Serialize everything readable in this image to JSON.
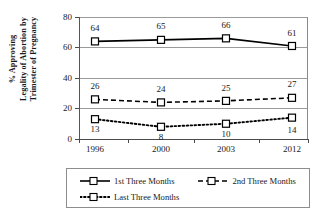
{
  "chart_data": {
    "type": "line",
    "title": "",
    "xlabel": "",
    "ylabel": "% Approving Legality of Abortion by Trimester of Pregnancy",
    "ylabel_lines": [
      "% Approving",
      "Legality of Abortion by",
      "Trimester of Pregnancy"
    ],
    "categories": [
      "1996",
      "2000",
      "2003",
      "2012"
    ],
    "ylim": [
      0,
      80
    ],
    "yticks": [
      "0",
      "20",
      "40",
      "60",
      "80"
    ],
    "grid": true,
    "legend_position": "bottom",
    "series": [
      {
        "name": "1st Three Months",
        "values": [
          64,
          65,
          66,
          61
        ],
        "line_style": "solid",
        "marker": "open-square",
        "label_position": "above",
        "color": "#000000"
      },
      {
        "name": "2nd Three Months",
        "values": [
          26,
          24,
          25,
          27
        ],
        "line_style": "dashed",
        "marker": "open-square",
        "label_position": "above",
        "color": "#000000"
      },
      {
        "name": "Last Three Months",
        "values": [
          13,
          8,
          10,
          14
        ],
        "line_style": "dotted",
        "marker": "open-square",
        "label_position": "below",
        "color": "#000000"
      }
    ]
  },
  "legend": {
    "entries": [
      {
        "label": "1st Three Months"
      },
      {
        "label": "2nd Three Months"
      },
      {
        "label": "Last Three Months"
      }
    ]
  },
  "colors": {
    "gridline": "#9a9a9a",
    "axis": "#4a4a4a",
    "series": "#000000",
    "background": "#ffffff"
  }
}
